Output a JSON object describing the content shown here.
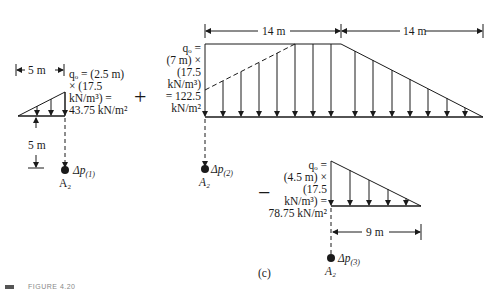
{
  "figure": {
    "panel_label": "(c)",
    "caption_fragment": "FIGURE 4.20",
    "operators": {
      "plus": "+",
      "minus": "−"
    }
  },
  "diagram1": {
    "width_dim": "5 m",
    "depth_dim": "5 m",
    "load_lines": [
      "qₒ = (2.5 m)",
      "× (17.5",
      "kN/m³) =",
      "43.75 kN/m²"
    ],
    "point_label": "A₂",
    "stress_label": "Δp",
    "stress_sub": "(1)"
  },
  "diagram2": {
    "dim_left": "14 m",
    "dim_right": "14 m",
    "load_lines": [
      "qₒ =",
      "(7 m) ×",
      "(17.5",
      "kN/m³)",
      "= 122.5",
      "kN/m²"
    ],
    "point_label": "A₂",
    "stress_label": "Δp",
    "stress_sub": "(2)"
  },
  "diagram3": {
    "width_dim": "9 m",
    "load_lines": [
      "qₒ =",
      "(4.5 m) ×",
      "(17.5",
      "kN/m³) =",
      "78.75 kN/m²"
    ],
    "point_label": "A₂",
    "stress_label": "Δp",
    "stress_sub": "(3)"
  }
}
